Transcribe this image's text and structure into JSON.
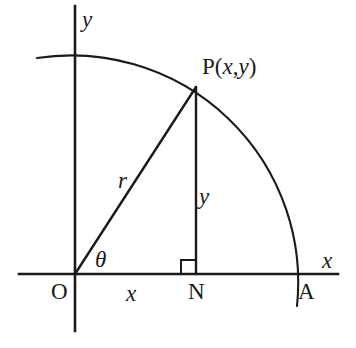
{
  "figure": {
    "type": "geometry-diagram",
    "background_color": "#ffffff",
    "stroke_color": "#1a1a1a"
  },
  "labels": {
    "y_axis": "y",
    "x_axis": "x",
    "point_p": "P(x,y)",
    "point_p_parts": {
      "name": "P",
      "open_paren": "(",
      "coord_x": "x",
      "comma": ",",
      "coord_y": "y",
      "close_paren": ")"
    },
    "radius": "r",
    "opposite_side": "y",
    "adjacent_side": "x",
    "angle": "θ",
    "origin": "O",
    "foot_of_perpendicular": "N",
    "arc_x_intercept": "A"
  },
  "geometry": {
    "origin": {
      "x": 75,
      "y": 274
    },
    "point_p": {
      "x": 196,
      "y": 87
    },
    "point_n": {
      "x": 196,
      "y": 274
    },
    "point_a": {
      "x": 302,
      "y": 274
    },
    "radius_px": 227,
    "x_axis": {
      "x1": 19,
      "y1": 274,
      "x2": 338,
      "y2": 274
    },
    "y_axis": {
      "x1": 75,
      "y1": 6,
      "x2": 75,
      "y2": 331
    },
    "arc": {
      "start_x": 37,
      "start_y": 58,
      "end_x": 297,
      "end_y": 306
    },
    "right_angle_marker": {
      "x": 181,
      "y": 259,
      "size": 14
    },
    "angle_arc_label_position": {
      "x": 95,
      "y": 248
    }
  }
}
